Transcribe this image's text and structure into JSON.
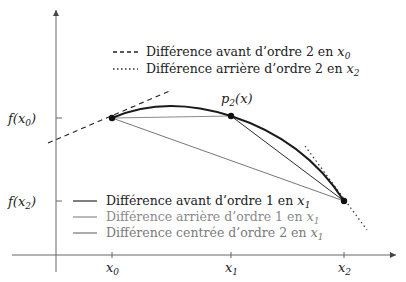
{
  "diagram": {
    "title": "",
    "colors": {
      "background": "#ffffff",
      "axis": "#555555",
      "curve": "#1a1a1a",
      "forward1": "#2a2a2a",
      "backward1": "#8a8a8a",
      "centered2": "#777777",
      "tangent": "#222222",
      "text_dark": "#222222",
      "text_gray": "#8a8a8a"
    },
    "axes": {
      "x_ticks": [
        {
          "base": "x",
          "sub": "0"
        },
        {
          "base": "x",
          "sub": "1"
        },
        {
          "base": "x",
          "sub": "2"
        }
      ],
      "y_ticks": [
        {
          "base": "f(x",
          "sub": "0",
          "close": ")"
        },
        {
          "base": "f(x",
          "sub": "2",
          "close": ")"
        }
      ]
    },
    "curve_label": {
      "base": "p",
      "sub": "2",
      "rest": "(x)"
    },
    "legend_top": [
      {
        "style": "dashed",
        "text": "Différence avant d’ordre 2 en ",
        "var": "x",
        "sub": "0"
      },
      {
        "style": "dotted",
        "text": "Différence arrière d’ordre 2 en ",
        "var": "x",
        "sub": "2"
      }
    ],
    "legend_bottom": [
      {
        "style": "solid-dark",
        "text": "Différence avant d’ordre 1 en ",
        "var": "x",
        "sub": "1"
      },
      {
        "style": "solid-light",
        "text": "Différence arrière d’ordre 1 en ",
        "var": "x",
        "sub": "1"
      },
      {
        "style": "solid-mid",
        "text": "Différence centrée d’ordre 2 en ",
        "var": "x",
        "sub": "1"
      }
    ],
    "points": [
      {
        "name": "P0",
        "x": 112,
        "y": 118
      },
      {
        "name": "P1",
        "x": 231,
        "y": 116
      },
      {
        "name": "P2",
        "x": 344,
        "y": 201
      }
    ]
  }
}
